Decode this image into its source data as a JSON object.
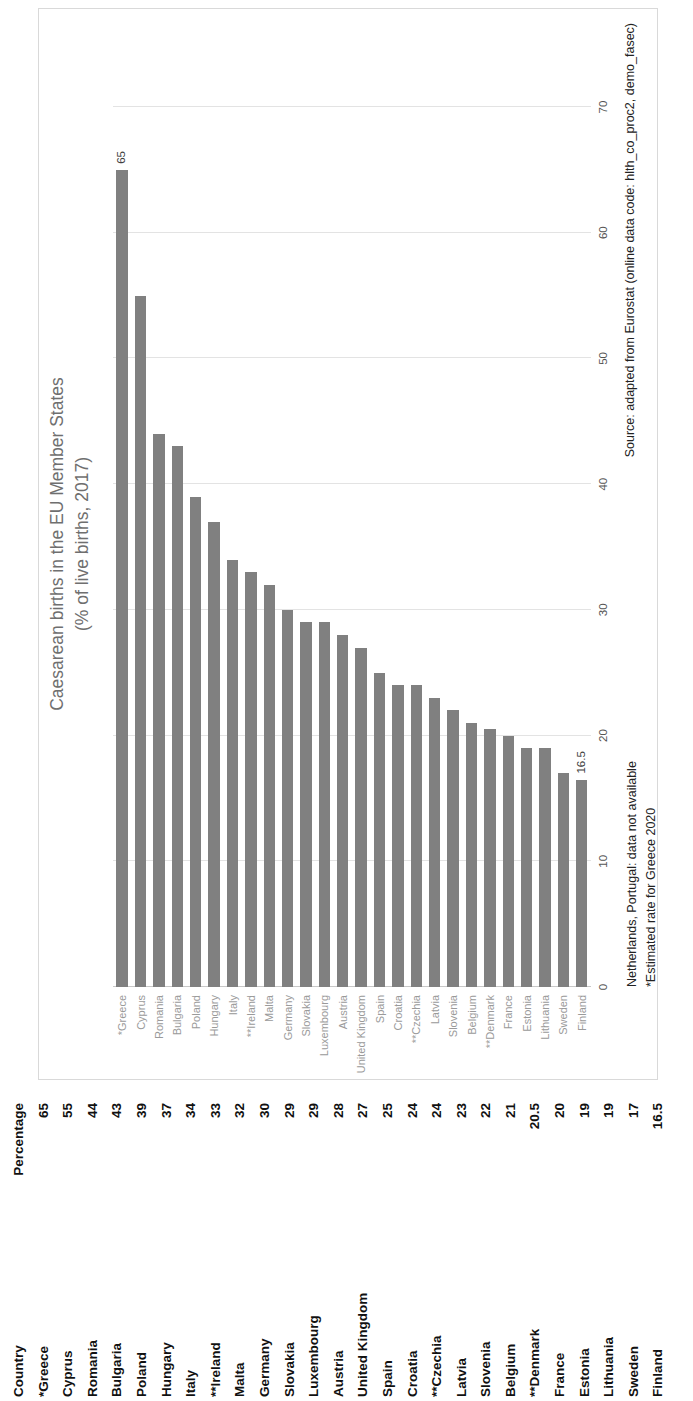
{
  "chart_data": {
    "type": "bar",
    "orientation": "horizontal",
    "title": "Caesarean births in the EU Member States",
    "subtitle": "(% of live births, 2017)",
    "xlabel": "",
    "ylabel": "",
    "xlim": [
      0,
      70
    ],
    "xticks": [
      "0",
      "10",
      "20",
      "30",
      "40",
      "50",
      "60",
      "70"
    ],
    "grid": true,
    "legend": "none",
    "bar_color": "#808080",
    "categories": [
      "*Greece",
      "Cyprus",
      "Romania",
      "Bulgaria",
      "Poland",
      "Hungary",
      "Italy",
      "**Ireland",
      "Malta",
      "Germany",
      "Slovakia",
      "Luxembourg",
      "Austria",
      "United Kingdom",
      "Spain",
      "Croatia",
      "**Czechia",
      "Latvia",
      "Slovenia",
      "Belgium",
      "**Denmark",
      "France",
      "Estonia",
      "Lithuania",
      "Sweden",
      "Finland"
    ],
    "values": [
      65,
      55,
      44,
      43,
      39,
      37,
      34,
      33,
      32,
      30,
      29,
      29,
      28,
      27,
      25,
      24,
      24,
      23,
      22,
      21,
      20.5,
      20,
      19,
      19,
      17,
      16.5
    ],
    "point_labels": {
      "*Greece": "65",
      "Finland": "16.5"
    },
    "annotations": [
      "Netherlands, Portugal: data not available",
      "*Estimated rate for Greece 2020"
    ],
    "source": "Source: adapted from Eurostat (online data code: hlth_co_proc2, demo_fasec)"
  },
  "notes": {
    "line1": "Netherlands, Portugal: data not available",
    "line2": "*Estimated rate for Greece 2020"
  },
  "source_text": "Source: adapted from Eurostat (online data code: hlth_co_proc2, demo_fasec)",
  "table": {
    "headers": [
      "Country",
      "Percentage"
    ],
    "rows": [
      [
        "*Greece",
        "65"
      ],
      [
        "Cyprus",
        "55"
      ],
      [
        "Romania",
        "44"
      ],
      [
        "Bulgaria",
        "43"
      ],
      [
        "Poland",
        "39"
      ],
      [
        "Hungary",
        "37"
      ],
      [
        "Italy",
        "34"
      ],
      [
        "**Ireland",
        "33"
      ],
      [
        "Malta",
        "32"
      ],
      [
        "Germany",
        "30"
      ],
      [
        "Slovakia",
        "29"
      ],
      [
        "Luxembourg",
        "29"
      ],
      [
        "Austria",
        "28"
      ],
      [
        "United Kingdom",
        "27"
      ],
      [
        "Spain",
        "25"
      ],
      [
        "Croatia",
        "24"
      ],
      [
        "**Czechia",
        "24"
      ],
      [
        "Latvia",
        "23"
      ],
      [
        "Slovenia",
        "22"
      ],
      [
        "Belgium",
        "21"
      ],
      [
        "**Denmark",
        "20.5"
      ],
      [
        "France",
        "20"
      ],
      [
        "Estonia",
        "19"
      ],
      [
        "Lithuania",
        "19"
      ],
      [
        "Sweden",
        "17"
      ],
      [
        "Finland",
        "16.5"
      ]
    ]
  }
}
